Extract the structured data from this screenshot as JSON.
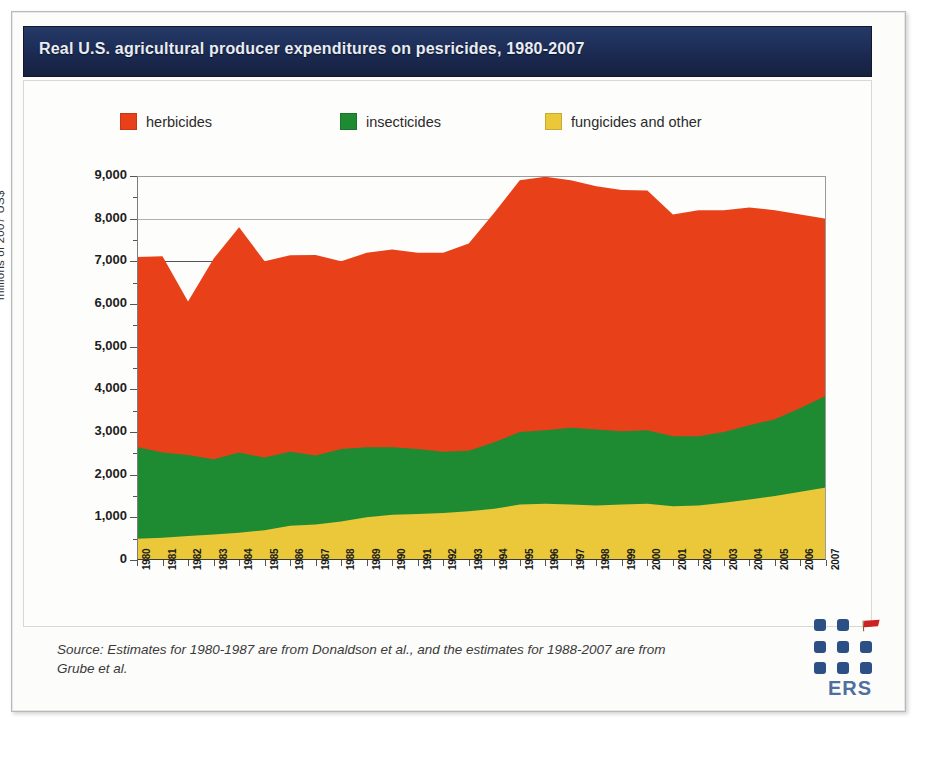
{
  "header": {
    "title": "Real U.S. agricultural producer expenditures on pesricides, 1980-2007"
  },
  "colors": {
    "title_bar": "#1b2a52",
    "herbicides": "#e8411a",
    "insecticides": "#1e8a32",
    "fungicides": "#eac83a",
    "logo_blue": "#2c4f86",
    "logo_red": "#cc2222"
  },
  "legend": {
    "position": "top",
    "items": [
      {
        "label": "herbicides",
        "color": "#e8411a",
        "icon": "legend-swatch"
      },
      {
        "label": "insecticides",
        "color": "#1e8a32",
        "icon": "legend-swatch"
      },
      {
        "label": "fungicides and other",
        "color": "#eac83a",
        "icon": "legend-swatch"
      }
    ]
  },
  "footer": {
    "source": "Source: Estimates for 1980-1987 are from Donaldson et al., and the estimates for 1988-2007 are from Grube et al.",
    "logo_text": "ERS"
  },
  "chart_data": {
    "type": "area",
    "stacked": true,
    "title": "Real U.S. agricultural producer expenditures on pesricides, 1980-2007",
    "xlabel": "",
    "ylabel": "millions of 2007 US$",
    "ylim": [
      0,
      9000
    ],
    "ytick_step": 1000,
    "yticks": [
      "9,000",
      "8,000",
      "7,000",
      "6,000",
      "5,000",
      "4,000",
      "3,000",
      "2,000",
      "1,000",
      "0"
    ],
    "grid": true,
    "legend_position": "top",
    "categories": [
      "1980",
      "1981",
      "1982",
      "1983",
      "1984",
      "1985",
      "1986",
      "1987",
      "1988",
      "1989",
      "1990",
      "1991",
      "1992",
      "1993",
      "1994",
      "1995",
      "1996",
      "1997",
      "1998",
      "1999",
      "2000",
      "2001",
      "2002",
      "2003",
      "2004",
      "2005",
      "2006",
      "2007"
    ],
    "series": [
      {
        "name": "fungicides and other",
        "color": "#eac83a",
        "values": [
          500,
          520,
          560,
          600,
          640,
          700,
          800,
          830,
          900,
          1000,
          1060,
          1080,
          1100,
          1140,
          1200,
          1300,
          1320,
          1300,
          1280,
          1300,
          1320,
          1260,
          1280,
          1340,
          1420,
          1500,
          1600,
          1700
        ]
      },
      {
        "name": "insecticides",
        "color": "#1e8a32",
        "values": [
          2150,
          2000,
          1900,
          1760,
          1880,
          1700,
          1740,
          1620,
          1700,
          1640,
          1580,
          1520,
          1440,
          1420,
          1560,
          1700,
          1720,
          1800,
          1780,
          1720,
          1720,
          1640,
          1620,
          1660,
          1740,
          1800,
          1960,
          2150
        ]
      },
      {
        "name": "herbicides",
        "color": "#e8411a",
        "values": [
          4450,
          4600,
          3600,
          4700,
          5280,
          4600,
          4600,
          4700,
          4400,
          4560,
          4640,
          4600,
          4660,
          4860,
          5380,
          5900,
          5940,
          5800,
          5700,
          5650,
          5620,
          5200,
          5300,
          5200,
          5100,
          4900,
          4540,
          4150
        ]
      }
    ],
    "stack_tops": {
      "fungicides_and_other": [
        500,
        520,
        560,
        600,
        640,
        700,
        800,
        830,
        900,
        1000,
        1060,
        1080,
        1100,
        1140,
        1200,
        1300,
        1320,
        1300,
        1280,
        1300,
        1320,
        1260,
        1280,
        1340,
        1420,
        1500,
        1600,
        1700
      ],
      "plus_insecticides": [
        2650,
        2520,
        2460,
        2360,
        2520,
        2400,
        2540,
        2450,
        2600,
        2640,
        2640,
        2600,
        2540,
        2560,
        2760,
        3000,
        3040,
        3100,
        3060,
        3020,
        3040,
        2900,
        2900,
        3000,
        3160,
        3300,
        3560,
        3850
      ],
      "total": [
        7100,
        7120,
        6060,
        7060,
        7800,
        7000,
        7140,
        7150,
        7000,
        7200,
        7280,
        7200,
        7200,
        7420,
        8140,
        8900,
        8980,
        8900,
        8760,
        8670,
        8660,
        8100,
        8200,
        8200,
        8260,
        8200,
        8100,
        8000
      ]
    }
  }
}
